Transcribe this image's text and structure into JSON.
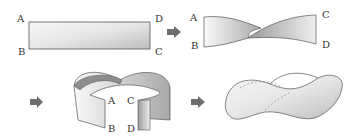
{
  "diagram": {
    "steps": [
      {
        "id": 1,
        "name": "flat-strip",
        "labels": {
          "tl": "A",
          "bl": "B",
          "tr": "D",
          "br": "C"
        }
      },
      {
        "id": 2,
        "name": "half-twist-strip",
        "labels": {
          "tl": "A",
          "bl": "B",
          "tr": "C",
          "br": "D"
        }
      },
      {
        "id": 3,
        "name": "ends-brought-together",
        "labels": {
          "a": "A",
          "c": "C",
          "b": "B",
          "d": "D"
        }
      },
      {
        "id": 4,
        "name": "mobius-strip",
        "labels": {}
      }
    ],
    "arrows": 3,
    "colors": {
      "arrow": "#6e6e6e",
      "strip_light": "#f2f2f2",
      "strip_dark": "#9a9a9a",
      "outline": "#555555"
    }
  }
}
